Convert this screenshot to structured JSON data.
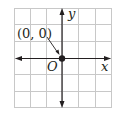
{
  "diagram": {
    "type": "coordinate-plane",
    "grid": {
      "columns": 6,
      "rows": 6,
      "color": "#c8c8c8"
    },
    "axes": {
      "x_label": "x",
      "y_label": "y",
      "color": "#231f20"
    },
    "origin": {
      "label": "O",
      "point_label": "(0, 0)"
    },
    "colors": {
      "axis": "#231f20",
      "grid": "#c8c8c8",
      "point": "#231f20",
      "background": "#ffffff"
    }
  }
}
